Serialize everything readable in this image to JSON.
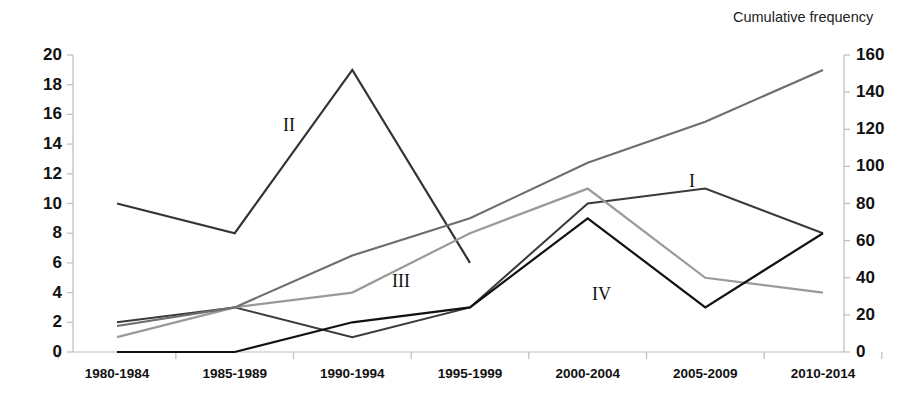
{
  "chart_data": {
    "type": "line",
    "title": "",
    "categories": [
      "1980-1984",
      "1985-1989",
      "1990-1994",
      "1995-1999",
      "2000-2004",
      "2005-2009",
      "2010-2014"
    ],
    "xlabel": "",
    "ylabel": "",
    "y_left": {
      "label": "",
      "ticks": [
        "0",
        "2",
        "4",
        "6",
        "8",
        "10",
        "12",
        "14",
        "16",
        "18",
        "20"
      ],
      "tick_values": [
        0,
        2,
        4,
        6,
        8,
        10,
        12,
        14,
        16,
        18,
        20
      ],
      "ylim": [
        0,
        20
      ]
    },
    "y_right": {
      "label": "Cumulative frequency",
      "ticks": [
        "0",
        "20",
        "40",
        "60",
        "80",
        "100",
        "120",
        "140",
        "160"
      ],
      "tick_values": [
        0,
        20,
        40,
        60,
        80,
        100,
        120,
        140,
        160
      ],
      "ylim": [
        0,
        160
      ]
    },
    "grid": false,
    "legend_position": "inline-annotations",
    "series": [
      {
        "name": "II",
        "label": "II",
        "axis": "left",
        "color": "#333333",
        "width": 2.2,
        "values": [
          10,
          8,
          19,
          6,
          null,
          null,
          null
        ],
        "label_x": 283,
        "label_y": 116
      },
      {
        "name": "I",
        "label": "I",
        "axis": "left",
        "color": "#3a3a3a",
        "width": 2.0,
        "values": [
          2,
          3,
          1,
          3,
          10,
          11,
          8
        ],
        "label_x": 689,
        "label_y": 172
      },
      {
        "name": "III",
        "label": "III",
        "axis": "left",
        "color": "#9a9a9a",
        "width": 2.2,
        "values": [
          1,
          3,
          4,
          8,
          11,
          5,
          4
        ],
        "label_x": 392,
        "label_y": 272
      },
      {
        "name": "IV",
        "label": "IV",
        "axis": "left",
        "color": "#111111",
        "width": 2.2,
        "values": [
          0,
          0,
          2,
          3,
          9,
          3,
          8
        ],
        "label_x": 592,
        "label_y": 285
      },
      {
        "name": "Cumulative frequency",
        "label": "",
        "axis": "right",
        "color": "#6e6e6e",
        "width": 2.2,
        "values": [
          14,
          24,
          52,
          72,
          102,
          124,
          152
        ],
        "label_x": 0,
        "label_y": 0
      }
    ]
  },
  "axes": {
    "right_title": "Cumulative frequency"
  }
}
